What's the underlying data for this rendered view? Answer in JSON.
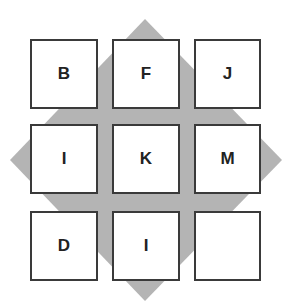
{
  "diagram": {
    "diamond_color": "#b4b4b4",
    "border_color": "#3a3a3a",
    "grid": [
      [
        "B",
        "F",
        "J"
      ],
      [
        "I",
        "K",
        "M"
      ],
      [
        "D",
        "I",
        ""
      ]
    ]
  }
}
